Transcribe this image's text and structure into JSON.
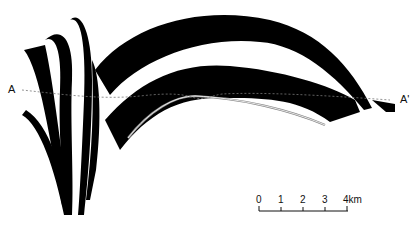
{
  "diagram": {
    "type": "geological cross-section",
    "section_labels": {
      "start": "A",
      "end": "A'"
    },
    "scale_bar": {
      "ticks": [
        "0",
        "1",
        "2",
        "3",
        "4km"
      ],
      "unit": "km"
    },
    "colors": {
      "layer": "#000000",
      "background": "#ffffff",
      "section_line": "#777777",
      "fault_line": "#888888"
    }
  }
}
